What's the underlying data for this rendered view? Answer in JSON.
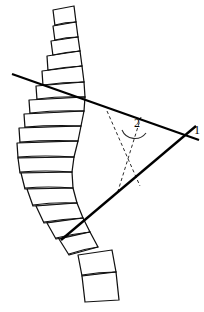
{
  "figure": {
    "domain": "anatomical-line-drawing",
    "background_color": "#ffffff",
    "ink_color": "#111111",
    "width": 204,
    "height": 312
  },
  "labels": [
    {
      "id": "label-1",
      "text": "1",
      "x": 194,
      "y": 134,
      "meaning": "intersection of the two end-vertebra tangent lines"
    },
    {
      "id": "label-2",
      "text": "2",
      "x": 134,
      "y": 127,
      "meaning": "Cobb angle between the perpendiculars"
    }
  ],
  "cobb_lines": [
    {
      "id": "upper-endplate-line",
      "x1": 12,
      "y1": 74,
      "x2": 199,
      "y2": 140,
      "stroke": "#000000",
      "stroke_width": 2.3,
      "description": "tangent to superior endplate of upper end vertebra"
    },
    {
      "id": "lower-endplate-line",
      "x1": 61,
      "y1": 240,
      "x2": 196,
      "y2": 126,
      "stroke": "#000000",
      "stroke_width": 2.3,
      "description": "tangent to inferior endplate of lower end vertebra"
    }
  ],
  "perpendiculars": [
    {
      "id": "upper-perpendicular",
      "x1": 107,
      "y1": 111,
      "x2": 140,
      "y2": 186,
      "stroke": "#2b2b2b",
      "dash": "3.2 2.6",
      "description": "perpendicular dropped from upper endplate line"
    },
    {
      "id": "lower-perpendicular",
      "x1": 141,
      "y1": 117,
      "x2": 118,
      "y2": 191,
      "stroke": "#2b2b2b",
      "dash": "3.2 2.6",
      "description": "perpendicular raised from lower endplate line"
    }
  ],
  "angle_arc": {
    "id": "cobb-angle-arc",
    "path": "M 122 130 A 14 14 0 0 0 146 133",
    "stroke": "#2b2b2b",
    "description": "arc marking the Cobb angle labelled 2"
  },
  "spine": {
    "description": "stack of vertebral bodies forming a lateral scoliotic curve, convex to the left",
    "vertebra_count": 18,
    "vertebrae": [
      {
        "name": "vertebra-01",
        "points": "53,10 74,6 76,22 55,26"
      },
      {
        "name": "vertebra-02",
        "points": "53,26 76,22 78,37 55,41"
      },
      {
        "name": "vertebra-03",
        "points": "51,41 78,37 80,51 53,56"
      },
      {
        "name": "vertebra-04",
        "points": "47,56 80,51 82,66 48,71"
      },
      {
        "name": "vertebra-05",
        "points": "42,71 82,66 84,82 43,86"
      },
      {
        "name": "vertebra-06",
        "points": "36,86 84,82 85,97 37,100"
      },
      {
        "name": "vertebra-07",
        "points": "29,100 85,97 84,111 30,114"
      },
      {
        "name": "vertebra-08",
        "points": "24,114 84,111 81,126 25,128"
      },
      {
        "name": "vertebra-09",
        "points": "19,128 81,126 78,141 20,143"
      },
      {
        "name": "vertebra-10",
        "points": "17,143 78,141 74,157 18,158"
      },
      {
        "name": "vertebra-11",
        "points": "18,158 74,157 72,172 20,173"
      },
      {
        "name": "vertebra-12",
        "points": "21,173 72,172 73,188 25,189"
      },
      {
        "name": "vertebra-13",
        "points": "27,189 73,188 77,203 33,206"
      },
      {
        "name": "vertebra-14",
        "points": "36,206 77,203 83,218 44,223"
      },
      {
        "name": "vertebra-15",
        "points": "47,223 83,218 90,232 56,239"
      },
      {
        "name": "vertebra-16",
        "points": "59,239 90,232 98,247 69,255"
      },
      {
        "name": "vertebra-17",
        "points": "78,255 112,250 116,272 82,276"
      },
      {
        "name": "vertebra-18",
        "points": "82,276 116,272 119,300 85,302"
      }
    ],
    "endplates": [
      {
        "name": "endplate-01",
        "d": "M 55,25 Q 65,22 76,22"
      },
      {
        "name": "endplate-02",
        "d": "M 55,40 Q 66,37 78,37"
      },
      {
        "name": "endplate-03",
        "d": "M 53,55 Q 66,52 80,51"
      },
      {
        "name": "endplate-04",
        "d": "M 48,70 Q 64,67 82,66"
      },
      {
        "name": "endplate-05",
        "d": "M 43,85 Q 63,82 84,82"
      },
      {
        "name": "endplate-06",
        "d": "M 37,99 Q 60,96 85,97"
      },
      {
        "name": "endplate-07",
        "d": "M 30,113 Q 56,110 84,111"
      },
      {
        "name": "endplate-08",
        "d": "M 25,127 Q 52,125 81,126"
      },
      {
        "name": "endplate-09",
        "d": "M 20,142 Q 48,140 78,141"
      },
      {
        "name": "endplate-10",
        "d": "M 18,157 Q 45,155 74,157"
      },
      {
        "name": "endplate-11",
        "d": "M 20,172 Q 45,170 72,172"
      },
      {
        "name": "endplate-12",
        "d": "M 25,188 Q 48,186 73,188"
      },
      {
        "name": "endplate-13",
        "d": "M 33,205 Q 54,202 77,203"
      },
      {
        "name": "endplate-14",
        "d": "M 44,222 Q 63,219 83,218"
      },
      {
        "name": "endplate-15",
        "d": "M 56,238 Q 72,234 90,232"
      },
      {
        "name": "endplate-16",
        "d": "M 69,254 Q 83,249 98,247"
      },
      {
        "name": "endplate-17",
        "d": "M 82,275 Q 99,272 116,272"
      }
    ]
  }
}
